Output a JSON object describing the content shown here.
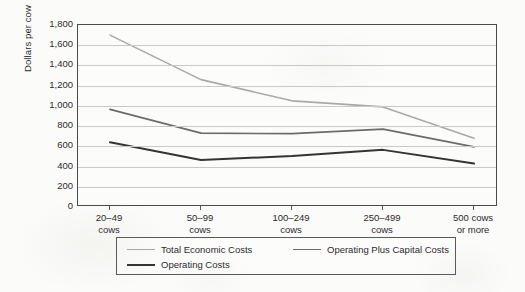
{
  "chart_data": {
    "type": "line",
    "title": "",
    "xlabel": "",
    "ylabel": "Dollars per cow",
    "ylim": [
      0,
      1800
    ],
    "ytick_step": 200,
    "grid": true,
    "legend_position": "bottom",
    "categories": [
      "20–49\ncows",
      "50–99\ncows",
      "100–249\ncows",
      "250–499\ncows",
      "500 cows\nor more"
    ],
    "category_lines": [
      [
        "20–49",
        "cows"
      ],
      [
        "50–99",
        "cows"
      ],
      [
        "100–249",
        "cows"
      ],
      [
        "250–499",
        "cows"
      ],
      [
        "500 cows",
        "or more"
      ]
    ],
    "ytick_labels": [
      "1,800",
      "1,600",
      "1,400",
      "1,200",
      "1,000",
      "800",
      "600",
      "400",
      "200",
      "0"
    ],
    "ytick_values": [
      1800,
      1600,
      1400,
      1200,
      1000,
      800,
      600,
      400,
      200,
      0
    ],
    "series": [
      {
        "name": "Total Economic Costs",
        "color": "#a9a9a9",
        "width": 1.6,
        "values": [
          1700,
          1260,
          1050,
          990,
          680
        ]
      },
      {
        "name": "Operating Plus Capital Costs",
        "color": "#6b6b6b",
        "width": 1.7,
        "values": [
          965,
          730,
          725,
          770,
          595
        ]
      },
      {
        "name": "Operating Costs",
        "color": "#343434",
        "width": 2.0,
        "values": [
          640,
          465,
          505,
          565,
          430
        ]
      }
    ]
  },
  "legend": {
    "entries": [
      {
        "label": "Total Economic Costs",
        "color": "#a9a9a9"
      },
      {
        "label": "Operating Plus Capital Costs",
        "color": "#6b6b6b"
      },
      {
        "label": "Operating Costs",
        "color": "#343434"
      }
    ]
  },
  "axis": {
    "y_title": "Dollars per cow"
  },
  "colors": {
    "background": "#fbfbf9",
    "axis": "#4a4a4a",
    "gridline": "#c9c9c9",
    "text": "#2b2b2b",
    "series_light": "#a9a9a9",
    "series_medium": "#6b6b6b",
    "series_dark": "#343434"
  }
}
